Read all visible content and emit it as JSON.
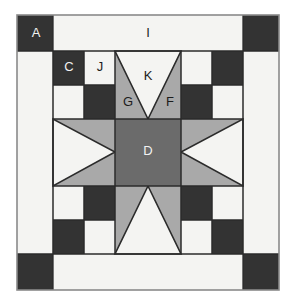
{
  "figure": {
    "kind": "quilt-block-piecing-diagram",
    "canvas": {
      "width": 296,
      "height": 305
    },
    "background": "#ffffff"
  },
  "palette": {
    "white": "#f4f4f2",
    "light_gray": "#a9a9a9",
    "medium_gray": "#6b6b6b",
    "dark": "#333333",
    "outline": "#2b2b2b",
    "frame": "#8a8a8a"
  },
  "geometry": {
    "frame": {
      "x": 17,
      "y": 15,
      "width": 262,
      "height": 275
    },
    "border_band": 34,
    "inner": {
      "x": 53,
      "y": 51,
      "width": 190,
      "height": 203
    },
    "cols": [
      53,
      84,
      115,
      181,
      212,
      243
    ],
    "rows": [
      51,
      85,
      119,
      186,
      220,
      254
    ]
  },
  "labels": [
    {
      "id": "A",
      "text": "A",
      "x": 36,
      "y": 34,
      "tone": "light"
    },
    {
      "id": "I",
      "text": "I",
      "x": 148,
      "y": 34,
      "tone": "dark"
    },
    {
      "id": "C",
      "text": "C",
      "x": 69,
      "y": 68,
      "tone": "light"
    },
    {
      "id": "J",
      "text": "J",
      "x": 100,
      "y": 68,
      "tone": "dark"
    },
    {
      "id": "K",
      "text": "K",
      "x": 148,
      "y": 77,
      "tone": "dark"
    },
    {
      "id": "G",
      "text": "G",
      "x": 128,
      "y": 103,
      "tone": "dark"
    },
    {
      "id": "F",
      "text": "F",
      "x": 170,
      "y": 103,
      "tone": "dark"
    },
    {
      "id": "D",
      "text": "D",
      "x": 148,
      "y": 152,
      "tone": "light"
    }
  ],
  "patch_legend": [
    {
      "code": "A",
      "name": "corner-square",
      "fabric": "dark"
    },
    {
      "code": "I",
      "name": "border-sashing-strip",
      "fabric": "white"
    },
    {
      "code": "C",
      "name": "checkerboard-dark",
      "fabric": "dark"
    },
    {
      "code": "J",
      "name": "checkerboard-light",
      "fabric": "white"
    },
    {
      "code": "K",
      "name": "star-point-center",
      "fabric": "white"
    },
    {
      "code": "G",
      "name": "star-point-left-geese",
      "fabric": "light_gray"
    },
    {
      "code": "F",
      "name": "star-point-right-geese",
      "fabric": "light_gray"
    },
    {
      "code": "D",
      "name": "center-square",
      "fabric": "medium_gray"
    }
  ]
}
